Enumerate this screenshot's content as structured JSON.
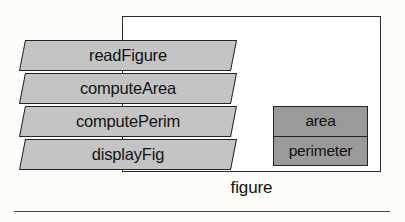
{
  "diagram": {
    "module": {
      "name": "figure",
      "caption": "figure"
    },
    "operations": [
      {
        "label": "readFigure"
      },
      {
        "label": "computeArea"
      },
      {
        "label": "computePerim"
      },
      {
        "label": "displayFig"
      }
    ],
    "attributes": [
      {
        "label": "area"
      },
      {
        "label": "perimeter"
      }
    ],
    "colors": {
      "operation_fill": "#c4c4c4",
      "attribute_fill": "#9a9a9a",
      "module_fill": "#ffffff",
      "stroke": "#242424",
      "page_background": "#fdfcf9",
      "rule": "#4a4a4a"
    }
  }
}
